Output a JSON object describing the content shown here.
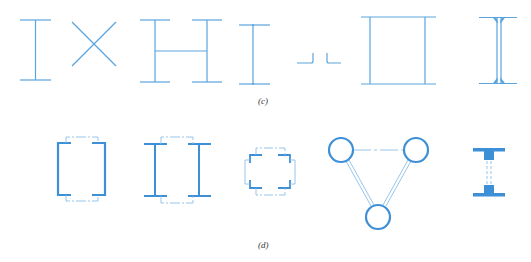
{
  "figure": {
    "colors": {
      "line": "#5aa5de",
      "heavy": "#3d8fd6",
      "dashed": "#8cbfe8",
      "label": "#333333"
    },
    "row_c": {
      "label": "(c)",
      "shapes": [
        {
          "name": "single-i-section",
          "type": "I-shape thin"
        },
        {
          "name": "x-bracing",
          "type": "crossed lines"
        },
        {
          "name": "h-built-up-section",
          "type": "two I-shapes joined by web"
        },
        {
          "name": "narrow-i-section",
          "type": "I-shape thin"
        },
        {
          "name": "double-angle-section",
          "type": "two angles back to back"
        },
        {
          "name": "box-section",
          "type": "two webs, two flanges"
        },
        {
          "name": "rolled-i-section",
          "type": "I-shape with fillets"
        }
      ]
    },
    "row_d": {
      "label": "(d)",
      "shapes": [
        {
          "name": "laced-channel-pair",
          "type": "two channels with lacing"
        },
        {
          "name": "laced-i-pair",
          "type": "two I-sections with lacing"
        },
        {
          "name": "laced-four-angle-section",
          "type": "four angles with lacing"
        },
        {
          "name": "triangular-tube-column",
          "type": "three tubes laced"
        },
        {
          "name": "heavy-tee-pair",
          "type": "two tees with lacing"
        }
      ]
    }
  }
}
